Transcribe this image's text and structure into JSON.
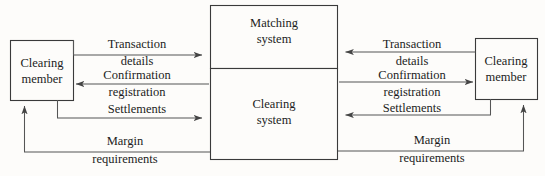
{
  "diagram": {
    "colors": {
      "background": "#fdfcfa",
      "box_stroke": "#3a3a3a",
      "line_stroke": "#555555",
      "text": "#1c1c1c"
    },
    "nodes": [
      {
        "id": "clearing-member-left",
        "line1": "Clearing",
        "line2": "member"
      },
      {
        "id": "matching-system",
        "line1": "Matching",
        "line2": "system"
      },
      {
        "id": "clearing-system",
        "line1": "Clearing",
        "line2": "system"
      },
      {
        "id": "clearing-member-right",
        "line1": "Clearing",
        "line2": "member"
      }
    ],
    "flows_left": [
      {
        "id": "transaction-details-left",
        "line1": "Transaction",
        "line2": "details",
        "direction": "right"
      },
      {
        "id": "confirmation-registration-left",
        "line1": "Confirmation",
        "line2": "registration",
        "direction": "left"
      },
      {
        "id": "settlements-left",
        "line1": "Settlements",
        "line2": "",
        "direction": "right"
      },
      {
        "id": "margin-requirements-left",
        "line1": "Margin",
        "line2": "requirements",
        "direction": "left-up"
      }
    ],
    "flows_right": [
      {
        "id": "transaction-details-right",
        "line1": "Transaction",
        "line2": "details",
        "direction": "left"
      },
      {
        "id": "confirmation-registration-right",
        "line1": "Confirmation",
        "line2": "registration",
        "direction": "right"
      },
      {
        "id": "settlements-right",
        "line1": "Settlements",
        "line2": "",
        "direction": "left"
      },
      {
        "id": "margin-requirements-right",
        "line1": "Margin",
        "line2": "requirements",
        "direction": "right-up"
      }
    ]
  }
}
